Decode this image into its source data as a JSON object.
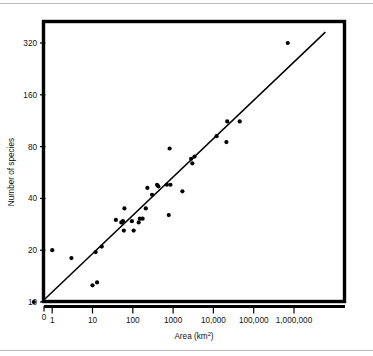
{
  "figure": {
    "background_color": "#ffffff",
    "frame_color": "#000000",
    "marker_color": "#000000",
    "line_color": "#000000",
    "rule_color": "#b9b9b9"
  },
  "chart_data": {
    "type": "scatter",
    "title": "",
    "xlabel": "Area (km2)",
    "xlabel_base": "Area (km",
    "xlabel_sup": "2",
    "xlabel_close": ")",
    "ylabel": "Number of species",
    "x_scale": "log",
    "y_scale": "log",
    "grid": false,
    "legend": "none",
    "xlim": [
      0.3,
      10000000
    ],
    "ylim": [
      10,
      420
    ],
    "xticks": [
      0,
      1,
      10,
      100,
      1000,
      10000,
      100000,
      1000000
    ],
    "xtick_labels": [
      "0",
      "1",
      "10",
      "100",
      "1000",
      "10,000",
      "100,000",
      "1,000,000"
    ],
    "yticks": [
      10,
      20,
      40,
      80,
      160,
      320
    ],
    "ytick_labels": [
      "10",
      "20",
      "40",
      "80",
      "160",
      "320"
    ],
    "y_origin_label": "0",
    "points": [
      {
        "x": 0.35,
        "y": 10
      },
      {
        "x": 1.0,
        "y": 20
      },
      {
        "x": 3.0,
        "y": 18
      },
      {
        "x": 10,
        "y": 12.5
      },
      {
        "x": 13,
        "y": 13
      },
      {
        "x": 12,
        "y": 19.5
      },
      {
        "x": 17,
        "y": 21
      },
      {
        "x": 38,
        "y": 30
      },
      {
        "x": 52,
        "y": 29
      },
      {
        "x": 57,
        "y": 29.5
      },
      {
        "x": 60,
        "y": 26
      },
      {
        "x": 62,
        "y": 35
      },
      {
        "x": 95,
        "y": 29.5
      },
      {
        "x": 105,
        "y": 26
      },
      {
        "x": 140,
        "y": 29
      },
      {
        "x": 150,
        "y": 30.5
      },
      {
        "x": 175,
        "y": 30.5
      },
      {
        "x": 210,
        "y": 35
      },
      {
        "x": 230,
        "y": 46
      },
      {
        "x": 300,
        "y": 42
      },
      {
        "x": 400,
        "y": 48
      },
      {
        "x": 430,
        "y": 47
      },
      {
        "x": 700,
        "y": 48
      },
      {
        "x": 780,
        "y": 32
      },
      {
        "x": 820,
        "y": 78
      },
      {
        "x": 860,
        "y": 48
      },
      {
        "x": 1700,
        "y": 44
      },
      {
        "x": 2800,
        "y": 68
      },
      {
        "x": 3000,
        "y": 64
      },
      {
        "x": 3400,
        "y": 70
      },
      {
        "x": 12000,
        "y": 92
      },
      {
        "x": 21000,
        "y": 85
      },
      {
        "x": 22000,
        "y": 112
      },
      {
        "x": 45000,
        "y": 112
      },
      {
        "x": 700000,
        "y": 320
      }
    ],
    "fit_line": {
      "type": "linear-on-log-log",
      "x_start": 0.55,
      "y_start": 10,
      "x_end": 6000000,
      "y_end": 370
    },
    "n_points": 35
  }
}
